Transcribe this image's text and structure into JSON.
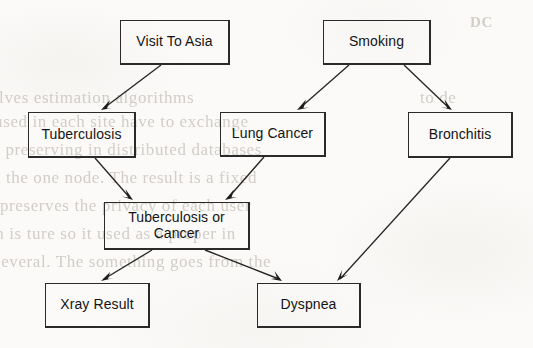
{
  "diagram": {
    "type": "directed-acyclic-graph",
    "background_color": "#fbfaf8",
    "node_border_color": "#2a2a2a",
    "edge_color": "#262626",
    "text_color": "#141414",
    "nodes": [
      {
        "id": "visit_to_asia",
        "label": "Visit To Asia",
        "x": 120,
        "y": 20,
        "w": 110,
        "h": 45
      },
      {
        "id": "smoking",
        "label": "Smoking",
        "x": 323,
        "y": 20,
        "w": 108,
        "h": 45
      },
      {
        "id": "tuberculosis",
        "label": "Tuberculosis",
        "x": 28,
        "y": 112,
        "w": 108,
        "h": 46
      },
      {
        "id": "lung_cancer",
        "label": "Lung Cancer",
        "x": 220,
        "y": 112,
        "w": 106,
        "h": 45
      },
      {
        "id": "bronchitis",
        "label": "Bronchitis",
        "x": 408,
        "y": 112,
        "w": 105,
        "h": 46
      },
      {
        "id": "tuberculosis_or_cancer",
        "label": "Tuberculosis or Cancer",
        "x": 104,
        "y": 202,
        "w": 146,
        "h": 48
      },
      {
        "id": "xray_result",
        "label": "Xray Result",
        "x": 45,
        "y": 283,
        "w": 105,
        "h": 45
      },
      {
        "id": "dyspnea",
        "label": "Dyspnea",
        "x": 257,
        "y": 283,
        "w": 104,
        "h": 45
      }
    ],
    "edges": [
      {
        "id": "edge-visit-to-tuberculosis",
        "from": "visit_to_asia",
        "to": "tuberculosis",
        "x1": 161,
        "y1": 65,
        "x2": 101,
        "y2": 110
      },
      {
        "id": "edge-smoking-to-lung-cancer",
        "from": "smoking",
        "to": "lung_cancer",
        "x1": 349,
        "y1": 65,
        "x2": 297,
        "y2": 110
      },
      {
        "id": "edge-smoking-to-bronchitis",
        "from": "smoking",
        "to": "bronchitis",
        "x1": 404,
        "y1": 65,
        "x2": 452,
        "y2": 110
      },
      {
        "id": "edge-tuberculosis-to-tbcancer",
        "from": "tuberculosis",
        "to": "tuberculosis_or_cancer",
        "x1": 95,
        "y1": 158,
        "x2": 133,
        "y2": 200
      },
      {
        "id": "edge-lung-cancer-to-tbcancer",
        "from": "lung_cancer",
        "to": "tuberculosis_or_cancer",
        "x1": 264,
        "y1": 157,
        "x2": 225,
        "y2": 200
      },
      {
        "id": "edge-bronchitis-to-dyspnea",
        "from": "bronchitis",
        "to": "dyspnea",
        "x1": 450,
        "y1": 158,
        "x2": 337,
        "y2": 281
      },
      {
        "id": "edge-tbcancer-to-xray",
        "from": "tuberculosis_or_cancer",
        "to": "xray_result",
        "x1": 152,
        "y1": 250,
        "x2": 101,
        "y2": 281
      },
      {
        "id": "edge-tbcancer-to-dyspnea",
        "from": "tuberculosis_or_cancer",
        "to": "dyspnea",
        "x1": 205,
        "y1": 250,
        "x2": 282,
        "y2": 281
      }
    ]
  },
  "ghost_text": {
    "note": "faint bleed-through text from the reverse side of the scanned page",
    "lines": [
      {
        "text": "DC",
        "x": 470,
        "y": 14,
        "size": 15,
        "weight": "700"
      },
      {
        "text": "olves estimation algorithms",
        "x": -10,
        "y": 88,
        "size": 17,
        "weight": "400"
      },
      {
        "text": "to  de",
        "x": 420,
        "y": 88,
        "size": 17,
        "weight": "400"
      },
      {
        "text": "s  used  in  each  site  have  to  exchange",
        "x": -18,
        "y": 112,
        "size": 17,
        "weight": "400"
      },
      {
        "text": "is  preserving  in  distributed  databases",
        "x": -12,
        "y": 140,
        "size": 17,
        "weight": "400"
      },
      {
        "text": "g the one node.  The result is a  fixed",
        "x": -8,
        "y": 168,
        "size": 17,
        "weight": "400"
      },
      {
        "text": "o  preserves  the  privacy  of  each  user",
        "x": -14,
        "y": 196,
        "size": 17,
        "weight": "400"
      },
      {
        "text": "th  is  ture  so  it  used  as  a  proper  in",
        "x": -10,
        "y": 224,
        "size": 17,
        "weight": "400"
      },
      {
        "text": "several.   The  something  goes  from  the",
        "x": -6,
        "y": 252,
        "size": 17,
        "weight": "400"
      }
    ]
  }
}
